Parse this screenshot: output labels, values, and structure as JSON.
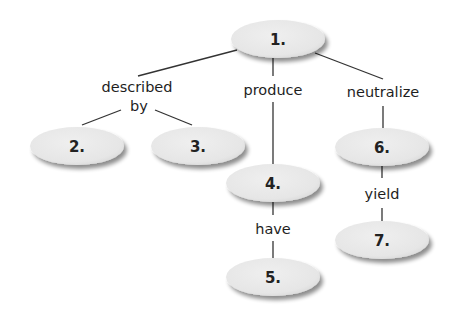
{
  "diagram": {
    "type": "concept-map",
    "colors": {
      "node_fill": "#e9e9e9",
      "node_shadow": "#9a9a9a",
      "line": "#333333",
      "text": "#222222"
    },
    "nodes": [
      {
        "id": "1",
        "label": "1.",
        "cx": 278,
        "cy": 39,
        "rx": 47,
        "ry": 19
      },
      {
        "id": "2",
        "label": "2.",
        "cx": 77,
        "cy": 146,
        "rx": 47,
        "ry": 19
      },
      {
        "id": "3",
        "label": "3.",
        "cx": 198,
        "cy": 146,
        "rx": 47,
        "ry": 19
      },
      {
        "id": "4",
        "label": "4.",
        "cx": 273,
        "cy": 183,
        "rx": 47,
        "ry": 19
      },
      {
        "id": "5",
        "label": "5.",
        "cx": 273,
        "cy": 277,
        "rx": 47,
        "ry": 19
      },
      {
        "id": "6",
        "label": "6.",
        "cx": 382,
        "cy": 147,
        "rx": 47,
        "ry": 19
      },
      {
        "id": "7",
        "label": "7.",
        "cx": 382,
        "cy": 240,
        "rx": 47,
        "ry": 19
      }
    ],
    "link_labels": {
      "described": "described",
      "by": "by",
      "produce": "produce",
      "neutralize": "neutralize",
      "have": "have",
      "yield": "yield"
    },
    "edges": [
      {
        "from": "1",
        "to": "2,3",
        "label": "described by"
      },
      {
        "from": "1",
        "to": "4",
        "label": "produce"
      },
      {
        "from": "1",
        "to": "6",
        "label": "neutralize"
      },
      {
        "from": "4",
        "to": "5",
        "label": "have"
      },
      {
        "from": "6",
        "to": "7",
        "label": "yield"
      }
    ]
  }
}
